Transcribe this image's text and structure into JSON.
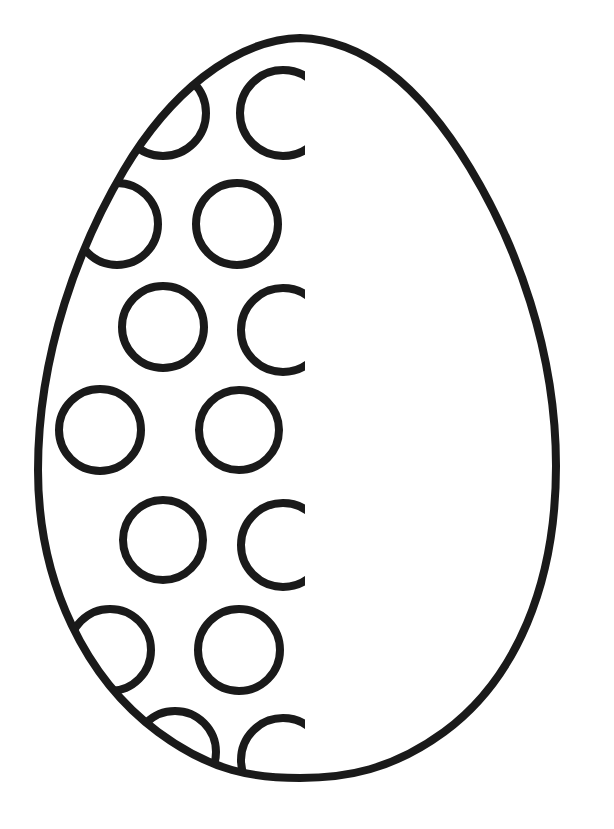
{
  "page": {
    "kind": "line-art-coloring-page",
    "width": 614,
    "height": 829,
    "background_color": "#ffffff",
    "ink_color": "#1a1a1a"
  },
  "artwork": {
    "name": "easter-egg-outline",
    "stroke_width": 8,
    "dot_stroke_width": 8,
    "egg": {
      "apex_top": {
        "x": 300,
        "y": 38
      },
      "apex_bottom": {
        "x": 300,
        "y": 775
      },
      "left_extreme": {
        "x": 38,
        "y": 492
      },
      "right_extreme": {
        "x": 556,
        "y": 452
      },
      "path": "M 300 38 C 232 40 168 96 124 170 C 80 244 38 352 38 470 C 38 586 88 680 158 732 C 212 772 254 778 300 778 C 346 778 392 770 444 732 C 516 679 556 584 556 466 C 556 350 516 244 470 168 C 424 92 368 40 300 38 Z"
    },
    "decoration_clip": {
      "description": "dots rendered only on the left portion of the egg, cut off at a vertical line",
      "clip_x_max": 305
    },
    "dots": [
      {
        "id": "dot-1",
        "cx": 283,
        "cy": 113,
        "r": 43,
        "state": "clipped-right"
      },
      {
        "id": "dot-2",
        "cx": 163,
        "cy": 113,
        "r": 43,
        "state": "clipped-by-egg-edge"
      },
      {
        "id": "dot-3",
        "cx": 237,
        "cy": 224,
        "r": 41,
        "state": "full"
      },
      {
        "id": "dot-4",
        "cx": 117,
        "cy": 224,
        "r": 41,
        "state": "clipped-by-egg-edge"
      },
      {
        "id": "dot-5",
        "cx": 283,
        "cy": 330,
        "r": 42,
        "state": "clipped-right"
      },
      {
        "id": "dot-6",
        "cx": 163,
        "cy": 327,
        "r": 41,
        "state": "full"
      },
      {
        "id": "dot-7",
        "cx": 239,
        "cy": 430,
        "r": 40,
        "state": "full"
      },
      {
        "id": "dot-8",
        "cx": 100,
        "cy": 430,
        "r": 41,
        "state": "clipped-by-egg-edge"
      },
      {
        "id": "dot-9",
        "cx": 283,
        "cy": 545,
        "r": 42,
        "state": "clipped-right"
      },
      {
        "id": "dot-10",
        "cx": 163,
        "cy": 540,
        "r": 40,
        "state": "full"
      },
      {
        "id": "dot-11",
        "cx": 239,
        "cy": 650,
        "r": 41,
        "state": "full"
      },
      {
        "id": "dot-12",
        "cx": 110,
        "cy": 650,
        "r": 41,
        "state": "clipped-by-egg-edge"
      },
      {
        "id": "dot-13",
        "cx": 283,
        "cy": 760,
        "r": 42,
        "state": "clipped-right-and-bottom"
      },
      {
        "id": "dot-14",
        "cx": 175,
        "cy": 752,
        "r": 41,
        "state": "clipped-by-egg-edge"
      }
    ]
  }
}
